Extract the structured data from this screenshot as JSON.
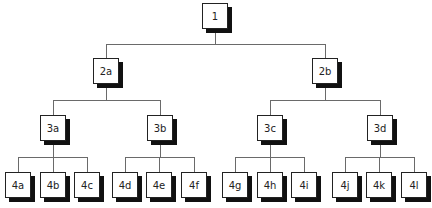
{
  "diagram": {
    "type": "tree",
    "root": "1",
    "nodes": [
      {
        "id": "1",
        "label": "1",
        "level": 1,
        "x": 202,
        "y": 3
      },
      {
        "id": "2a",
        "label": "2a",
        "level": 2,
        "x": 93,
        "y": 58,
        "parent": "1"
      },
      {
        "id": "2b",
        "label": "2b",
        "level": 2,
        "x": 312,
        "y": 58,
        "parent": "1"
      },
      {
        "id": "3a",
        "label": "3a",
        "level": 3,
        "x": 40,
        "y": 115,
        "parent": "2a"
      },
      {
        "id": "3b",
        "label": "3b",
        "level": 3,
        "x": 147,
        "y": 115,
        "parent": "2a"
      },
      {
        "id": "3c",
        "label": "3c",
        "level": 3,
        "x": 257,
        "y": 115,
        "parent": "2b"
      },
      {
        "id": "3d",
        "label": "3d",
        "level": 3,
        "x": 367,
        "y": 115,
        "parent": "2b"
      },
      {
        "id": "4a",
        "label": "4a",
        "level": 4,
        "x": 5,
        "y": 172,
        "parent": "3a"
      },
      {
        "id": "4b",
        "label": "4b",
        "level": 4,
        "x": 40,
        "y": 172,
        "parent": "3a"
      },
      {
        "id": "4c",
        "label": "4c",
        "level": 4,
        "x": 74,
        "y": 172,
        "parent": "3a"
      },
      {
        "id": "4d",
        "label": "4d",
        "level": 4,
        "x": 112,
        "y": 172,
        "parent": "3b"
      },
      {
        "id": "4e",
        "label": "4e",
        "level": 4,
        "x": 146,
        "y": 172,
        "parent": "3b"
      },
      {
        "id": "4f",
        "label": "4f",
        "level": 4,
        "x": 181,
        "y": 172,
        "parent": "3b"
      },
      {
        "id": "4g",
        "label": "4g",
        "level": 4,
        "x": 222,
        "y": 172,
        "parent": "3c"
      },
      {
        "id": "4h",
        "label": "4h",
        "level": 4,
        "x": 257,
        "y": 172,
        "parent": "3c"
      },
      {
        "id": "4i",
        "label": "4i",
        "level": 4,
        "x": 291,
        "y": 172,
        "parent": "3c"
      },
      {
        "id": "4j",
        "label": "4j",
        "level": 4,
        "x": 332,
        "y": 172,
        "parent": "3d"
      },
      {
        "id": "4k",
        "label": "4k",
        "level": 4,
        "x": 366,
        "y": 172,
        "parent": "3d"
      },
      {
        "id": "4l",
        "label": "4l",
        "level": 4,
        "x": 401,
        "y": 172,
        "parent": "3d"
      }
    ],
    "colors": {
      "line": "#6a6a6a",
      "box_border": "#222222",
      "shadow": "#111111",
      "background": "#ffffff"
    }
  }
}
